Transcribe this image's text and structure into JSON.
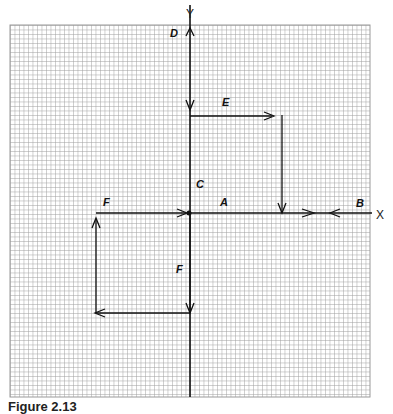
{
  "axes": {
    "x_label": "X",
    "y_label": "Y"
  },
  "vectors": [
    {
      "id": "A",
      "label": "A"
    },
    {
      "id": "B",
      "label": "B"
    },
    {
      "id": "C",
      "label": "C"
    },
    {
      "id": "D",
      "label": "D"
    },
    {
      "id": "E",
      "label": "E"
    },
    {
      "id": "F1",
      "label": "F"
    },
    {
      "id": "F2",
      "label": "F"
    }
  ],
  "caption": "Figure 2.13",
  "colors": {
    "grid": "#9a9a9a",
    "ink": "#111111",
    "background": "#ffffff"
  }
}
